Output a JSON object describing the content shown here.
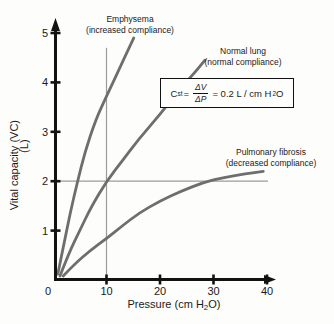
{
  "labels": {
    "emphysema_line1": "Emphysema",
    "emphysema_line2": "(increased compliance)",
    "normal_line1": "Normal lung",
    "normal_line2": "(normal compliance)",
    "fibrosis_line1": "Pulmonary fibrosis",
    "fibrosis_line2": "(decreased compliance)",
    "ylabel_main": "Vital capacity (VC)",
    "ylabel_unit": "(L)",
    "xlabel_pre": "Pressure (cm H",
    "xlabel_sub": "2",
    "xlabel_post": "O)"
  },
  "formula": {
    "lhs": "C",
    "lhs_sub": "st",
    "eq1": "=",
    "num": "ΔV",
    "den": "ΔP",
    "eq2": "= 0.2 L / cm H",
    "water_sub": "2",
    "water_o": "O"
  },
  "chart_data": {
    "type": "line",
    "title": "",
    "xlabel": "Pressure (cm H₂O)",
    "ylabel": "Vital capacity (VC) (L)",
    "xlim": [
      0,
      42
    ],
    "ylim": [
      0,
      5.2
    ],
    "x_ticks": [
      0,
      10,
      20,
      30,
      40
    ],
    "y_ticks": [
      1,
      2,
      3,
      4,
      5
    ],
    "grid": false,
    "legend_position": "curve-end-annotations",
    "annotation": "Cst = ΔV/ΔP = 0.2 L / cm H₂O",
    "reference_lines": {
      "vertical_x": 10,
      "vertical_top_y": 4.7,
      "horizontal_y": 2,
      "horizontal_right_x": 40
    },
    "series": [
      {
        "name": "Emphysema (increased compliance)",
        "x": [
          0.9,
          2.0,
          3.2,
          4.6,
          6.0,
          8.0,
          10.0,
          12.0,
          13.7,
          15.1
        ],
        "y": [
          0.12,
          0.7,
          1.35,
          2.0,
          2.6,
          3.25,
          3.72,
          4.18,
          4.58,
          4.9
        ]
      },
      {
        "name": "Normal lung (normal compliance)",
        "x": [
          1.3,
          3.0,
          5.0,
          7.0,
          10.0,
          13.0,
          16.0,
          20.0,
          24.0,
          26.5,
          28.4
        ],
        "y": [
          0.08,
          0.55,
          1.0,
          1.45,
          2.0,
          2.42,
          2.85,
          3.35,
          3.9,
          4.2,
          4.45
        ]
      },
      {
        "name": "Pulmonary fibrosis (decreased compliance)",
        "x": [
          1.9,
          4.0,
          7.0,
          10.0,
          13.0,
          16.0,
          20.0,
          24.0,
          28.0,
          32.0,
          36.0,
          39.3
        ],
        "y": [
          0.08,
          0.32,
          0.6,
          0.84,
          1.1,
          1.35,
          1.6,
          1.8,
          1.97,
          2.08,
          2.15,
          2.2
        ]
      }
    ],
    "colors": {
      "curve": "#6e6e6e",
      "axis": "#121212",
      "reference_line": "#9b9b9b",
      "background": "#fdfdfc"
    }
  }
}
